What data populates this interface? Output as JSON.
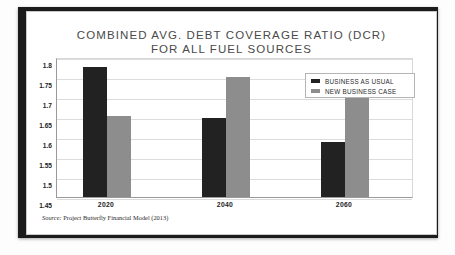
{
  "slide": {
    "title_line1": "COMBINED AVG. DEBT COVERAGE RATIO (DCR)",
    "title_line2": "FOR ALL FUEL SOURCES",
    "source_prefix": "Source:",
    "source_text": "Project Butterfly Financial Model (2013)"
  },
  "colors": {
    "business_as_usual": "#222222",
    "new_business_case": "#8d8d8d",
    "gridline": "#dcdcdc",
    "axis": "#9a9a9a",
    "title_text": "#4a4a4a",
    "card_background": "#ffffff",
    "frame": "#1b1b1b"
  },
  "chart_data": {
    "type": "bar",
    "title": "COMBINED AVG. DEBT COVERAGE RATIO (DCR) FOR ALL FUEL SOURCES",
    "subtitle": "",
    "xlabel": "",
    "ylabel": "",
    "categories": [
      "2020",
      "2040",
      "2060"
    ],
    "series": [
      {
        "name": "BUSINESS AS USUAL",
        "color": "#222222",
        "values": [
          1.775,
          1.648,
          1.588
        ]
      },
      {
        "name": "NEW BUSINESS CASE",
        "color": "#8d8d8d",
        "values": [
          1.652,
          1.75,
          1.718
        ]
      }
    ],
    "ylim": [
      1.45,
      1.8
    ],
    "yticks": [
      "1.8",
      "1.75",
      "1.7",
      "1.65",
      "1.6",
      "1.55",
      "1.5",
      "1.45"
    ],
    "ytick_values": [
      1.8,
      1.75,
      1.7,
      1.65,
      1.6,
      1.55,
      1.5,
      1.45
    ],
    "grid": true,
    "legend_position": "top-right"
  }
}
